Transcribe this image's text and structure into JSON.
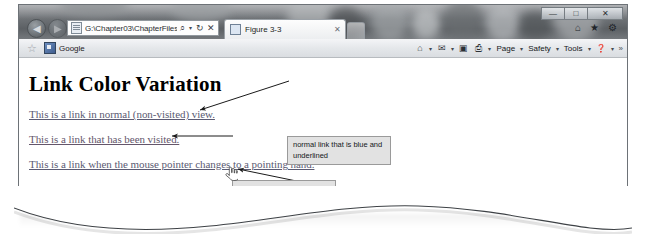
{
  "browser": {
    "nav": {
      "back_label": "◀",
      "forward_label": "▶"
    },
    "address": {
      "value": "G:\\Chapter03\\ChapterFiles\\Fi",
      "placeholder": "",
      "search_icon": "⌕",
      "refresh_icon": "↻",
      "stop_icon": "✕",
      "favicon_name": "page-favicon"
    },
    "tab": {
      "title": "Figure 3-3",
      "close_label": "✕"
    },
    "new_tab_label": "",
    "caption_buttons": {
      "minimize": "—",
      "maximize": "□",
      "close": "✕"
    },
    "title_icons": [
      {
        "name": "home-icon",
        "glyph": "⌂"
      },
      {
        "name": "favorites-star-icon",
        "glyph": "★"
      },
      {
        "name": "tools-gear-icon",
        "glyph": "⚙"
      }
    ],
    "favorites_bar": {
      "add_star": "☆",
      "items": [
        {
          "label": "Google",
          "icon": "google-bookmark-icon"
        }
      ]
    },
    "command_bar": {
      "icons": [
        {
          "name": "feeds-icon",
          "glyph": "⌂",
          "caret": "▾"
        },
        {
          "name": "read-mail-icon",
          "glyph": "✉",
          "caret": "▾"
        },
        {
          "name": "rss-icon",
          "glyph": "▣",
          "caret": ""
        },
        {
          "name": "print-icon",
          "glyph": "⎙",
          "caret": "▾"
        }
      ],
      "menus": [
        {
          "label": "Page",
          "caret": "▾"
        },
        {
          "label": "Safety",
          "caret": "▾"
        },
        {
          "label": "Tools",
          "caret": "▾"
        },
        {
          "label": "❓",
          "caret": "▾"
        }
      ],
      "overflow": "»"
    }
  },
  "page": {
    "heading": "Link Color Variation",
    "links": [
      {
        "text": "This is a link in normal (non-visited) view.",
        "color": "#5b5b73",
        "state": "normal"
      },
      {
        "text": "This is a link that has been visited.",
        "color": "#64566b",
        "state": "visited"
      },
      {
        "text": "This is a link when the mouse pointer changes to a pointing hand.",
        "color": "#5b5b73",
        "state": "hover"
      }
    ],
    "cursor_name": "pointing-hand-cursor"
  },
  "callouts": [
    {
      "id": "callout-normal-link",
      "text": "normal link that is blue and underlined"
    },
    {
      "id": "callout-visited-link",
      "text": "visited link that is purple and underlined"
    },
    {
      "id": "callout-hover-cursor",
      "text": "when mouse pointer hovers over a text link, it turns into a pointing hand"
    }
  ],
  "colors": {
    "callout_fill": "#e2e2e2",
    "callout_border": "#9a9a9a",
    "window_border": "#6d7277",
    "chrome_bg": "#e4e7ea"
  }
}
